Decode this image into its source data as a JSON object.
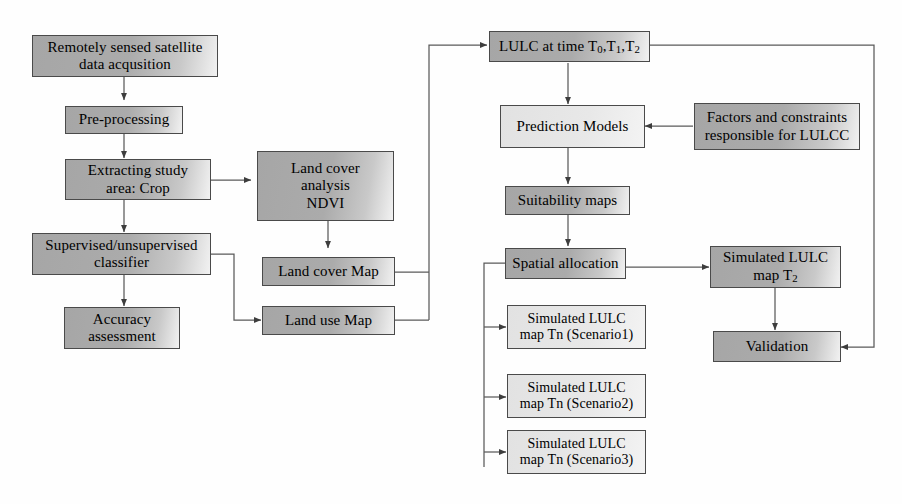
{
  "diagram": {
    "colors": {
      "node_fill_dark": "#a9a9a9",
      "node_fill_light": "#e8e8e8",
      "node_border": "#4a4a4a",
      "edge_stroke": "#5a5a5a",
      "background": "#fefefe",
      "text": "#000000"
    }
  },
  "nodes": {
    "acquisition": {
      "label": "Remotely sensed satellite\ndata acqusition"
    },
    "preprocessing": {
      "label": "Pre-processing"
    },
    "extracting": {
      "label": "Extracting study\narea: Crop"
    },
    "classifier": {
      "label": "Supervised/unsupervised\nclassifier"
    },
    "accuracy": {
      "label": "Accuracy\nassessment"
    },
    "ndvi": {
      "label": "Land cover\nanalysis\nNDVI"
    },
    "land_cover_map": {
      "label": "Land cover Map"
    },
    "land_use_map": {
      "label": "Land use Map"
    },
    "lulc_time": {
      "label_prefix": "LULC at time T",
      "sub0": "0",
      "mid1": ",T",
      "sub1": "1",
      "mid2": ",T",
      "sub2": "2"
    },
    "prediction": {
      "label": "Prediction Models"
    },
    "factors": {
      "label": "Factors and constraints\nresponsible for LULCC"
    },
    "suitability": {
      "label": "Suitability maps"
    },
    "spatial": {
      "label": "Spatial allocation"
    },
    "sim_t2": {
      "label_line1": "Simulated LULC",
      "label_line2_prefix": "map T",
      "label_line2_sub": "2"
    },
    "validation": {
      "label": "Validation"
    },
    "scenario1": {
      "label": "Simulated LULC\nmap Tn (Scenario1)"
    },
    "scenario2": {
      "label": "Simulated LULC\nmap Tn (Scenario2)"
    },
    "scenario3": {
      "label": "Simulated LULC\nmap Tn (Scenario3)"
    }
  },
  "edges": [
    {
      "name": "acquisition-to-preprocessing",
      "from": "acquisition",
      "to": "preprocessing"
    },
    {
      "name": "preprocessing-to-extracting",
      "from": "preprocessing",
      "to": "extracting"
    },
    {
      "name": "extracting-to-classifier",
      "from": "extracting",
      "to": "classifier"
    },
    {
      "name": "extracting-to-ndvi",
      "from": "extracting",
      "to": "ndvi"
    },
    {
      "name": "classifier-to-accuracy",
      "from": "classifier",
      "to": "accuracy"
    },
    {
      "name": "classifier-to-land-use-map",
      "from": "classifier",
      "to": "land_use_map"
    },
    {
      "name": "ndvi-to-land-cover-map",
      "from": "ndvi",
      "to": "land_cover_map"
    },
    {
      "name": "land-cover-map-to-lulc",
      "from": "land_cover_map",
      "to": "lulc_time"
    },
    {
      "name": "land-use-map-to-lulc",
      "from": "land_use_map",
      "to": "lulc_time"
    },
    {
      "name": "lulc-to-prediction",
      "from": "lulc_time",
      "to": "prediction"
    },
    {
      "name": "factors-to-prediction",
      "from": "factors",
      "to": "prediction"
    },
    {
      "name": "prediction-to-suitability",
      "from": "prediction",
      "to": "suitability"
    },
    {
      "name": "suitability-to-spatial",
      "from": "suitability",
      "to": "spatial"
    },
    {
      "name": "spatial-to-sim-t2",
      "from": "spatial",
      "to": "sim_t2"
    },
    {
      "name": "spatial-to-scenario1",
      "from": "spatial",
      "to": "scenario1"
    },
    {
      "name": "spatial-to-scenario2",
      "from": "spatial",
      "to": "scenario2"
    },
    {
      "name": "spatial-to-scenario3",
      "from": "spatial",
      "to": "scenario3"
    },
    {
      "name": "sim-t2-to-validation",
      "from": "sim_t2",
      "to": "validation"
    },
    {
      "name": "lulc-to-validation",
      "from": "lulc_time",
      "to": "validation"
    }
  ]
}
